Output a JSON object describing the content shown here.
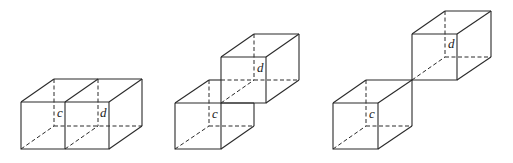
{
  "figures": [
    {
      "name": "figure-side-by-side",
      "description": "Two unit cubes sharing a full face, side by side",
      "labels": {
        "c": "c",
        "d": "d"
      }
    },
    {
      "name": "figure-edge-stacked",
      "description": "Two unit cubes sharing an edge, upper cube offset diagonally",
      "labels": {
        "c": "c",
        "d": "d"
      }
    },
    {
      "name": "figure-vertex-touching",
      "description": "Two unit cubes touching at a single vertex",
      "labels": {
        "c": "c",
        "d": "d"
      }
    }
  ],
  "colors": {
    "stroke": "#2a2a2a",
    "background": "#ffffff"
  }
}
